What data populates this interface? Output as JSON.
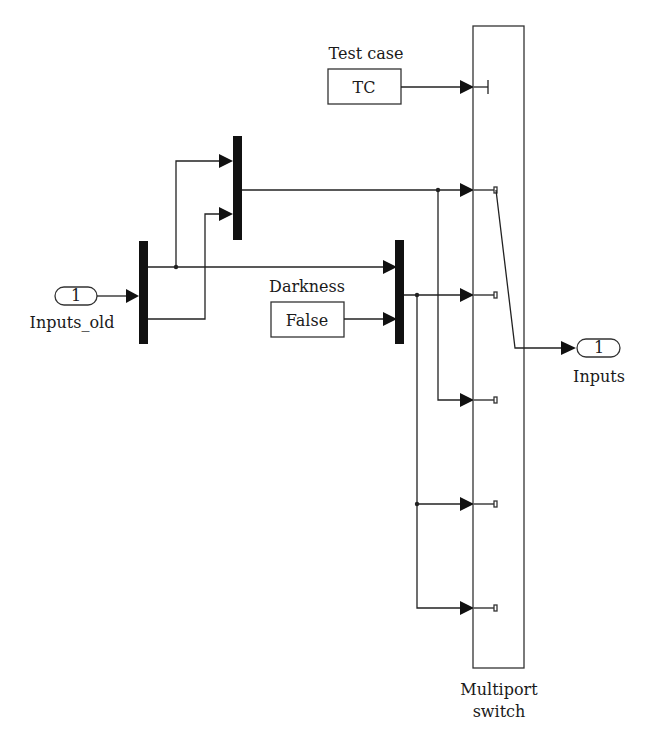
{
  "diagram": {
    "title": "",
    "blocks": {
      "test_case": {
        "label": "Test case",
        "value": "TC"
      },
      "darkness": {
        "label": "Darkness",
        "value": "False"
      },
      "inport": {
        "label": "Inputs_old",
        "port_number": "1"
      },
      "outport": {
        "label": "Inputs",
        "port_number": "1"
      },
      "switch": {
        "label_line1": "Multiport",
        "label_line2": "switch"
      },
      "mux1": {
        "inputs": 1,
        "outputs": 2
      },
      "mux2": {
        "inputs": 2,
        "outputs": 1
      },
      "mux3": {
        "inputs": 2,
        "outputs": 1
      }
    },
    "switch_data_inputs": 6,
    "colors": {
      "line": "#222222",
      "background": "#ffffff"
    }
  }
}
